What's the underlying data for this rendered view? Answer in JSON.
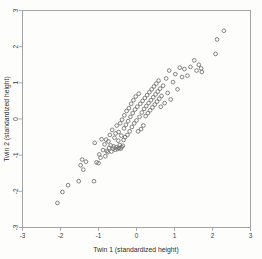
{
  "chart_data": {
    "type": "scatter",
    "title": "",
    "xlabel": "Twin 1 (standardized height)",
    "ylabel": "Twin 2 (standardized height)",
    "xlim": [
      -3,
      3
    ],
    "ylim": [
      -3,
      3
    ],
    "xticks": [
      -3,
      -2,
      -1,
      0,
      1,
      2,
      3
    ],
    "yticks": [
      -3,
      -2,
      -1,
      0,
      1,
      2,
      3
    ],
    "xtick_labels": [
      "-3",
      "-2",
      "-1",
      "0",
      "1",
      "2",
      "3"
    ],
    "ytick_labels": [
      "-3",
      "-2",
      "-1",
      "0",
      "1",
      "2",
      "3"
    ],
    "grid": false,
    "legend": false,
    "marker": "open-circle",
    "marker_color": "#6f6f6f",
    "frame_color": "#9a9a9a",
    "background": "#fdfdfc",
    "points": [
      [
        -2.08,
        -2.32
      ],
      [
        -1.95,
        -2.02
      ],
      [
        -1.8,
        -1.83
      ],
      [
        -1.52,
        -1.72
      ],
      [
        -1.47,
        -1.28
      ],
      [
        -1.43,
        -1.12
      ],
      [
        -1.4,
        -1.4
      ],
      [
        -1.33,
        -1.18
      ],
      [
        -1.12,
        -1.72
      ],
      [
        -1.1,
        -0.66
      ],
      [
        -1.05,
        -1.2
      ],
      [
        -1.0,
        -1.22
      ],
      [
        -0.98,
        -0.98
      ],
      [
        -0.95,
        -1.07
      ],
      [
        -0.92,
        -0.56
      ],
      [
        -0.88,
        -0.86
      ],
      [
        -0.84,
        -0.7
      ],
      [
        -0.82,
        -1.03
      ],
      [
        -0.8,
        -0.57
      ],
      [
        -0.78,
        -0.88
      ],
      [
        -0.76,
        -0.92
      ],
      [
        -0.74,
        -0.62
      ],
      [
        -0.72,
        -0.8
      ],
      [
        -0.7,
        -0.44
      ],
      [
        -0.68,
        -0.73
      ],
      [
        -0.66,
        -0.9
      ],
      [
        -0.64,
        -0.3
      ],
      [
        -0.62,
        -0.82
      ],
      [
        -0.6,
        -0.76
      ],
      [
        -0.58,
        -0.52
      ],
      [
        -0.56,
        -0.85
      ],
      [
        -0.55,
        -0.4
      ],
      [
        -0.53,
        -0.78
      ],
      [
        -0.52,
        -0.18
      ],
      [
        -0.5,
        -0.83
      ],
      [
        -0.48,
        -0.6
      ],
      [
        -0.47,
        -0.36
      ],
      [
        -0.46,
        -0.8
      ],
      [
        -0.44,
        -0.72
      ],
      [
        -0.43,
        -0.12
      ],
      [
        -0.42,
        -0.82
      ],
      [
        -0.4,
        -0.46
      ],
      [
        -0.39,
        -0.78
      ],
      [
        -0.38,
        -0.02
      ],
      [
        -0.36,
        -0.74
      ],
      [
        -0.34,
        -0.58
      ],
      [
        -0.33,
        -0.26
      ],
      [
        -0.32,
        0.1
      ],
      [
        -0.3,
        -0.5
      ],
      [
        -0.28,
        -0.16
      ],
      [
        -0.26,
        0.22
      ],
      [
        -0.24,
        -0.44
      ],
      [
        -0.22,
        -0.06
      ],
      [
        -0.2,
        0.3
      ],
      [
        -0.18,
        -0.34
      ],
      [
        -0.16,
        0.06
      ],
      [
        -0.14,
        0.42
      ],
      [
        -0.12,
        -0.22
      ],
      [
        -0.1,
        0.16
      ],
      [
        -0.08,
        0.52
      ],
      [
        -0.06,
        -0.12
      ],
      [
        -0.04,
        0.26
      ],
      [
        -0.02,
        0.62
      ],
      [
        0.0,
        -0.04
      ],
      [
        0.02,
        0.34
      ],
      [
        0.04,
        -0.34
      ],
      [
        0.06,
        0.7
      ],
      [
        0.08,
        0.06
      ],
      [
        0.1,
        0.42
      ],
      [
        0.12,
        -0.28
      ],
      [
        0.14,
        0.18
      ],
      [
        0.16,
        0.5
      ],
      [
        0.18,
        -0.18
      ],
      [
        0.2,
        0.28
      ],
      [
        0.22,
        0.58
      ],
      [
        0.24,
        0.08
      ],
      [
        0.26,
        0.36
      ],
      [
        0.28,
        0.66
      ],
      [
        0.3,
        0.16
      ],
      [
        0.32,
        0.44
      ],
      [
        0.34,
        0.74
      ],
      [
        0.36,
        0.24
      ],
      [
        0.38,
        0.52
      ],
      [
        0.4,
        0.82
      ],
      [
        0.42,
        0.32
      ],
      [
        0.44,
        0.6
      ],
      [
        0.46,
        0.9
      ],
      [
        0.48,
        0.4
      ],
      [
        0.5,
        0.68
      ],
      [
        0.52,
        0.98
      ],
      [
        0.54,
        0.48
      ],
      [
        0.56,
        0.76
      ],
      [
        0.58,
        1.06
      ],
      [
        0.6,
        0.56
      ],
      [
        0.62,
        0.84
      ],
      [
        0.64,
        0.34
      ],
      [
        0.66,
        0.64
      ],
      [
        0.7,
        0.92
      ],
      [
        0.74,
        0.44
      ],
      [
        0.78,
        1.12
      ],
      [
        0.82,
        0.72
      ],
      [
        0.86,
        1.34
      ],
      [
        0.9,
        0.54
      ],
      [
        0.96,
        1.02
      ],
      [
        1.02,
        1.24
      ],
      [
        1.08,
        0.82
      ],
      [
        1.14,
        1.42
      ],
      [
        1.2,
        1.16
      ],
      [
        1.26,
        1.38
      ],
      [
        1.34,
        1.2
      ],
      [
        1.42,
        1.44
      ],
      [
        1.52,
        1.62
      ],
      [
        1.58,
        1.34
      ],
      [
        1.64,
        1.5
      ],
      [
        1.7,
        1.4
      ],
      [
        1.72,
        1.3
      ],
      [
        2.08,
        1.8
      ],
      [
        2.12,
        2.2
      ],
      [
        2.3,
        2.44
      ]
    ]
  }
}
